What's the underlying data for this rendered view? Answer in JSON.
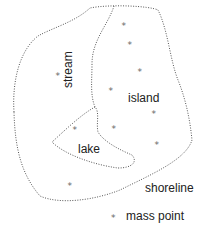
{
  "diagram": {
    "labels": {
      "stream": "stream",
      "island": "island",
      "lake": "lake",
      "shoreline": "shoreline",
      "mass_point": "mass point"
    },
    "legend": {
      "symbol": "*",
      "label": "mass point"
    },
    "mass_points": [
      {
        "x": 58,
        "y": 75
      },
      {
        "x": 75,
        "y": 129
      },
      {
        "x": 124,
        "y": 25
      },
      {
        "x": 130,
        "y": 44
      },
      {
        "x": 140,
        "y": 71
      },
      {
        "x": 111,
        "y": 90
      },
      {
        "x": 154,
        "y": 113
      },
      {
        "x": 114,
        "y": 128
      },
      {
        "x": 157,
        "y": 144
      },
      {
        "x": 70,
        "y": 185
      }
    ],
    "colors": {
      "line": "#555555",
      "text": "#222222",
      "point": "#666666"
    }
  }
}
